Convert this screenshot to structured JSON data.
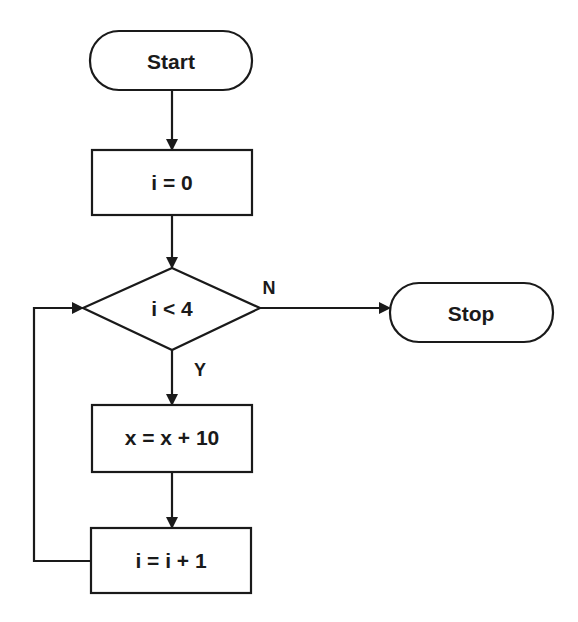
{
  "diagram": {
    "type": "flowchart",
    "nodes": {
      "start": {
        "label": "Start",
        "shape": "terminal"
      },
      "init": {
        "label": "i = 0",
        "shape": "process"
      },
      "cond": {
        "label": "i < 4",
        "shape": "decision"
      },
      "stop": {
        "label": "Stop",
        "shape": "terminal"
      },
      "body": {
        "label": "x = x + 10",
        "shape": "process"
      },
      "incr": {
        "label": "i = i + 1",
        "shape": "process"
      }
    },
    "edges": {
      "no_label": "N",
      "yes_label": "Y"
    },
    "colors": {
      "stroke": "#1a1a1a",
      "background": "#ffffff"
    }
  }
}
